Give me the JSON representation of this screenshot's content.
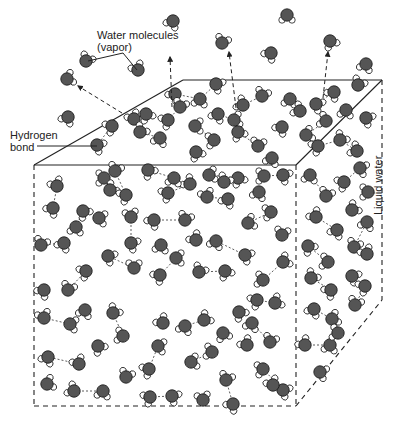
{
  "diagram": {
    "labels": {
      "vapor_line1": "Water molecules",
      "vapor_line2": "(vapor)",
      "hbond_line1": "Hydrogen",
      "hbond_line2": "bond",
      "liquid": "Liquid water"
    },
    "colors": {
      "oxygen": "#555555",
      "hydrogen": "#ffffff",
      "outline": "#1a1a1a",
      "edge": "#222222",
      "bond": "#333333"
    },
    "cube": {
      "front_top_left": [
        34,
        165
      ],
      "front_top_right": [
        296,
        165
      ],
      "front_bottom_left": [
        34,
        406
      ],
      "front_bottom_right": [
        296,
        406
      ],
      "back_top_left": [
        183,
        80
      ],
      "back_top_right": [
        382,
        80
      ],
      "back_bottom_right": [
        382,
        300
      ]
    },
    "arrows": [
      {
        "from": [
          122,
          113
        ],
        "to": [
          78,
          86
        ]
      },
      {
        "from": [
          172,
          107
        ],
        "to": [
          170,
          57
        ]
      },
      {
        "from": [
          236,
          108
        ],
        "to": [
          229,
          52
        ]
      },
      {
        "from": [
          323,
          98
        ],
        "to": [
          328,
          52
        ]
      }
    ],
    "leader_lines": [
      {
        "points": [
          [
            88,
            61
          ],
          [
            123,
            53
          ],
          [
            137,
            70
          ]
        ]
      },
      {
        "points": [
          [
            37,
            146
          ],
          [
            97,
            146
          ]
        ]
      }
    ],
    "vapor_molecules": [
      [
        173,
        21,
        30
      ],
      [
        287,
        15,
        0
      ],
      [
        222,
        43,
        200
      ],
      [
        271,
        53,
        40
      ],
      [
        330,
        41,
        330
      ],
      [
        366,
        64,
        20
      ],
      [
        86,
        61,
        210
      ],
      [
        138,
        70,
        150
      ],
      [
        67,
        79,
        250
      ],
      [
        68,
        117,
        30
      ]
    ],
    "liquid_molecules": [
      [
        175,
        94,
        40
      ],
      [
        200,
        99,
        10
      ],
      [
        216,
        84,
        300
      ],
      [
        243,
        105,
        120
      ],
      [
        262,
        96,
        200
      ],
      [
        146,
        114,
        330
      ],
      [
        168,
        120,
        60
      ],
      [
        180,
        107,
        200
      ],
      [
        218,
        114,
        30
      ],
      [
        234,
        120,
        260
      ],
      [
        290,
        99,
        10
      ],
      [
        300,
        111,
        120
      ],
      [
        316,
        104,
        300
      ],
      [
        334,
        92,
        40
      ],
      [
        358,
        85,
        210
      ],
      [
        134,
        119,
        150
      ],
      [
        112,
        126,
        60
      ],
      [
        97,
        145,
        300
      ],
      [
        140,
        132,
        220
      ],
      [
        160,
        138,
        20
      ],
      [
        195,
        126,
        270
      ],
      [
        214,
        140,
        80
      ],
      [
        238,
        132,
        330
      ],
      [
        258,
        146,
        190
      ],
      [
        282,
        127,
        40
      ],
      [
        306,
        135,
        250
      ],
      [
        326,
        121,
        110
      ],
      [
        346,
        110,
        10
      ],
      [
        366,
        118,
        300
      ],
      [
        318,
        146,
        60
      ],
      [
        340,
        140,
        220
      ],
      [
        357,
        151,
        120
      ],
      [
        196,
        152,
        330
      ],
      [
        272,
        158,
        20
      ],
      [
        41,
        245,
        200
      ],
      [
        64,
        243,
        30
      ],
      [
        83,
        211,
        320
      ],
      [
        104,
        178,
        90
      ],
      [
        110,
        190,
        230
      ],
      [
        76,
        227,
        10
      ],
      [
        131,
        217,
        170
      ],
      [
        131,
        243,
        300
      ],
      [
        154,
        220,
        40
      ],
      [
        185,
        220,
        200
      ],
      [
        168,
        193,
        60
      ],
      [
        190,
        184,
        130
      ],
      [
        209,
        175,
        260
      ],
      [
        238,
        178,
        330
      ],
      [
        259,
        192,
        20
      ],
      [
        57,
        186,
        150
      ],
      [
        53,
        208,
        40
      ],
      [
        99,
        218,
        280
      ],
      [
        126,
        195,
        60
      ],
      [
        115,
        171,
        200
      ],
      [
        148,
        170,
        320
      ],
      [
        174,
        178,
        10
      ],
      [
        224,
        182,
        210
      ],
      [
        264,
        176,
        90
      ],
      [
        283,
        175,
        300
      ],
      [
        207,
        197,
        160
      ],
      [
        228,
        199,
        30
      ],
      [
        248,
        223,
        250
      ],
      [
        271,
        212,
        80
      ],
      [
        282,
        235,
        190
      ],
      [
        245,
        255,
        300
      ],
      [
        216,
        241,
        20
      ],
      [
        196,
        240,
        140
      ],
      [
        176,
        258,
        270
      ],
      [
        160,
        275,
        50
      ],
      [
        199,
        272,
        210
      ],
      [
        225,
        271,
        330
      ],
      [
        263,
        280,
        100
      ],
      [
        283,
        262,
        240
      ],
      [
        161,
        245,
        10
      ],
      [
        134,
        268,
        180
      ],
      [
        108,
        256,
        300
      ],
      [
        86,
        271,
        60
      ],
      [
        68,
        290,
        200
      ],
      [
        44,
        290,
        40
      ],
      [
        44,
        318,
        160
      ],
      [
        70,
        324,
        280
      ],
      [
        85,
        310,
        20
      ],
      [
        113,
        313,
        220
      ],
      [
        123,
        336,
        100
      ],
      [
        98,
        346,
        320
      ],
      [
        79,
        364,
        150
      ],
      [
        48,
        357,
        30
      ],
      [
        47,
        384,
        250
      ],
      [
        74,
        391,
        120
      ],
      [
        103,
        391,
        10
      ],
      [
        126,
        377,
        200
      ],
      [
        149,
        369,
        60
      ],
      [
        158,
        346,
        280
      ],
      [
        163,
        323,
        140
      ],
      [
        185,
        326,
        20
      ],
      [
        204,
        320,
        230
      ],
      [
        223,
        333,
        340
      ],
      [
        212,
        352,
        100
      ],
      [
        191,
        362,
        260
      ],
      [
        226,
        380,
        200
      ],
      [
        233,
        404,
        40
      ],
      [
        203,
        400,
        170
      ],
      [
        172,
        396,
        300
      ],
      [
        150,
        397,
        60
      ],
      [
        252,
        323,
        20
      ],
      [
        270,
        342,
        200
      ],
      [
        263,
        369,
        80
      ],
      [
        283,
        390,
        300
      ],
      [
        273,
        385,
        150
      ],
      [
        257,
        300,
        60
      ],
      [
        275,
        303,
        240
      ],
      [
        247,
        345,
        140
      ],
      [
        239,
        312,
        320
      ],
      [
        310,
        175,
        10
      ],
      [
        326,
        196,
        200
      ],
      [
        344,
        182,
        60
      ],
      [
        360,
        168,
        290
      ],
      [
        316,
        217,
        140
      ],
      [
        337,
        230,
        30
      ],
      [
        352,
        210,
        230
      ],
      [
        368,
        192,
        90
      ],
      [
        308,
        246,
        320
      ],
      [
        328,
        262,
        100
      ],
      [
        354,
        247,
        200
      ],
      [
        367,
        222,
        20
      ],
      [
        311,
        278,
        220
      ],
      [
        331,
        290,
        50
      ],
      [
        352,
        276,
        300
      ],
      [
        367,
        254,
        150
      ],
      [
        314,
        309,
        30
      ],
      [
        332,
        319,
        250
      ],
      [
        305,
        345,
        140
      ],
      [
        330,
        345,
        10
      ],
      [
        355,
        305,
        200
      ],
      [
        365,
        286,
        60
      ],
      [
        320,
        372,
        290
      ],
      [
        338,
        333,
        100
      ]
    ],
    "hydrogen_bonds": [
      [
        [
          175,
          94
        ],
        [
          200,
          99
        ]
      ],
      [
        [
          200,
          99
        ],
        [
          216,
          84
        ]
      ],
      [
        [
          243,
          105
        ],
        [
          262,
          96
        ]
      ],
      [
        [
          146,
          114
        ],
        [
          168,
          120
        ]
      ],
      [
        [
          180,
          107
        ],
        [
          168,
          120
        ]
      ],
      [
        [
          218,
          114
        ],
        [
          234,
          120
        ]
      ],
      [
        [
          290,
          99
        ],
        [
          300,
          111
        ]
      ],
      [
        [
          316,
          104
        ],
        [
          334,
          92
        ]
      ],
      [
        [
          112,
          126
        ],
        [
          97,
          145
        ]
      ],
      [
        [
          140,
          132
        ],
        [
          160,
          138
        ]
      ],
      [
        [
          195,
          126
        ],
        [
          214,
          140
        ]
      ],
      [
        [
          238,
          132
        ],
        [
          258,
          146
        ]
      ],
      [
        [
          306,
          135
        ],
        [
          326,
          121
        ]
      ],
      [
        [
          340,
          140
        ],
        [
          357,
          151
        ]
      ],
      [
        [
          318,
          146
        ],
        [
          340,
          140
        ]
      ],
      [
        [
          41,
          245
        ],
        [
          64,
          243
        ]
      ],
      [
        [
          83,
          211
        ],
        [
          76,
          227
        ]
      ],
      [
        [
          104,
          178
        ],
        [
          110,
          190
        ]
      ],
      [
        [
          131,
          217
        ],
        [
          131,
          243
        ]
      ],
      [
        [
          154,
          220
        ],
        [
          185,
          220
        ]
      ],
      [
        [
          168,
          193
        ],
        [
          190,
          184
        ]
      ],
      [
        [
          209,
          175
        ],
        [
          238,
          178
        ]
      ],
      [
        [
          53,
          208
        ],
        [
          57,
          186
        ]
      ],
      [
        [
          115,
          171
        ],
        [
          126,
          195
        ]
      ],
      [
        [
          148,
          170
        ],
        [
          174,
          178
        ]
      ],
      [
        [
          264,
          176
        ],
        [
          283,
          175
        ]
      ],
      [
        [
          207,
          197
        ],
        [
          228,
          199
        ]
      ],
      [
        [
          248,
          223
        ],
        [
          271,
          212
        ]
      ],
      [
        [
          245,
          255
        ],
        [
          216,
          241
        ]
      ],
      [
        [
          176,
          258
        ],
        [
          160,
          275
        ]
      ],
      [
        [
          199,
          272
        ],
        [
          225,
          271
        ]
      ],
      [
        [
          263,
          280
        ],
        [
          283,
          262
        ]
      ],
      [
        [
          134,
          268
        ],
        [
          108,
          256
        ]
      ],
      [
        [
          86,
          271
        ],
        [
          68,
          290
        ]
      ],
      [
        [
          44,
          318
        ],
        [
          70,
          324
        ]
      ],
      [
        [
          113,
          313
        ],
        [
          123,
          336
        ]
      ],
      [
        [
          79,
          364
        ],
        [
          48,
          357
        ]
      ],
      [
        [
          74,
          391
        ],
        [
          103,
          391
        ]
      ],
      [
        [
          149,
          369
        ],
        [
          158,
          346
        ]
      ],
      [
        [
          185,
          326
        ],
        [
          204,
          320
        ]
      ],
      [
        [
          212,
          352
        ],
        [
          191,
          362
        ]
      ],
      [
        [
          226,
          380
        ],
        [
          233,
          404
        ]
      ],
      [
        [
          172,
          396
        ],
        [
          150,
          397
        ]
      ],
      [
        [
          252,
          323
        ],
        [
          270,
          342
        ]
      ],
      [
        [
          263,
          369
        ],
        [
          283,
          390
        ]
      ],
      [
        [
          257,
          300
        ],
        [
          275,
          303
        ]
      ],
      [
        [
          310,
          175
        ],
        [
          326,
          196
        ]
      ],
      [
        [
          344,
          182
        ],
        [
          360,
          168
        ]
      ],
      [
        [
          316,
          217
        ],
        [
          337,
          230
        ]
      ],
      [
        [
          308,
          246
        ],
        [
          328,
          262
        ]
      ],
      [
        [
          354,
          247
        ],
        [
          367,
          222
        ]
      ],
      [
        [
          311,
          278
        ],
        [
          331,
          290
        ]
      ],
      [
        [
          314,
          309
        ],
        [
          332,
          319
        ]
      ],
      [
        [
          305,
          345
        ],
        [
          330,
          345
        ]
      ],
      [
        [
          355,
          305
        ],
        [
          365,
          286
        ]
      ]
    ]
  }
}
